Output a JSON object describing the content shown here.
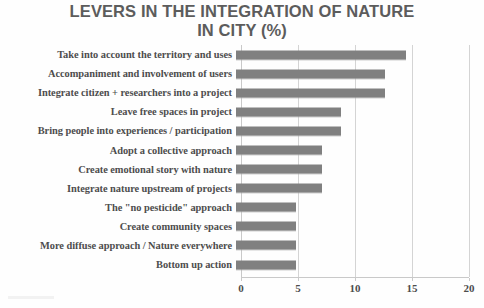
{
  "chart_data": {
    "type": "bar",
    "orientation": "horizontal",
    "title": "LEVERS IN THE INTEGRATION OF NATURE\nIN CITY (%)",
    "xlabel": "",
    "ylabel": "",
    "xlim": [
      0,
      20
    ],
    "xticks": [
      0,
      5,
      10,
      15,
      20
    ],
    "xtick_labels": [
      "0",
      "5",
      "10",
      "15",
      "20"
    ],
    "grid": true,
    "grid_axis": "x",
    "legend": false,
    "bar_color": "#808080",
    "categories": [
      "Take into account the territory and uses",
      "Accompaniment and involvement of users",
      "Integrate citizen + researchers  into a project",
      "Leave free spaces in project",
      "Bring people into experiences / participation",
      "Adopt a collective approach",
      "Create emotional story with nature",
      "Integrate nature upstream of projects",
      "The \"no pesticide\" approach",
      "Create community spaces",
      "More diffuse approach / Nature everywhere",
      "Bottom up action"
    ],
    "values": [
      14.9,
      13.1,
      13.1,
      9.2,
      9.2,
      7.5,
      7.5,
      7.5,
      5.3,
      5.3,
      5.3,
      5.3
    ]
  }
}
